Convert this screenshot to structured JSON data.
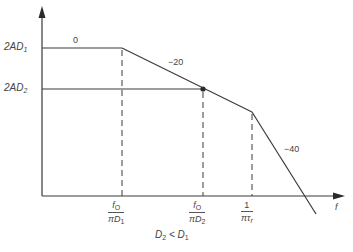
{
  "diagram": {
    "type": "asymptotic bode magnitude plot",
    "axes": {
      "x_label": "f",
      "y_levels": [
        {
          "label_main": "2AD",
          "label_sub": "1",
          "y_px": 48
        },
        {
          "label_main": "2AD",
          "label_sub": "2",
          "y_px": 89
        }
      ]
    },
    "slopes": [
      {
        "label": "0",
        "segment": "flat"
      },
      {
        "label": "−20",
        "segment": "first rolloff"
      },
      {
        "label": "−40",
        "segment": "second rolloff"
      }
    ],
    "x_ticks": [
      {
        "numerator": "f",
        "numerator_sub": "O",
        "denominator_prefix": "πD",
        "denominator_sub": "1"
      },
      {
        "numerator": "f",
        "numerator_sub": "O",
        "denominator_prefix": "πD",
        "denominator_sub": "2"
      },
      {
        "numerator": "1",
        "numerator_sub": "",
        "denominator_prefix": "πτ",
        "denominator_sub": "r"
      }
    ],
    "caption": {
      "main": "D",
      "sub": "2",
      "rel": " < D",
      "sub2": "1"
    },
    "colors": {
      "line": "#3a3a3a",
      "background": "#ffffff"
    }
  }
}
